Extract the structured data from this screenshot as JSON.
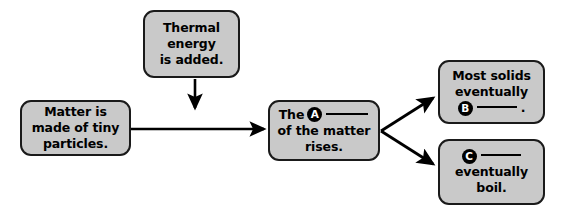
{
  "diagram": {
    "type": "flowchart",
    "background_color": "#ffffff",
    "node_fill_color": "#c9c9c9",
    "node_border_color": "#1a1a1a",
    "text_color": "#000000",
    "marker_fill_color": "#000000",
    "marker_text_color": "#ffffff",
    "nodes": [
      {
        "id": "thermal",
        "name": "thermal-energy-node",
        "lines": [
          "Thermal",
          "energy",
          "is added."
        ],
        "marker": null
      },
      {
        "id": "matter",
        "name": "matter-particles-node",
        "lines": [
          "Matter is",
          "made of tiny",
          "particles."
        ],
        "marker": null
      },
      {
        "id": "middle",
        "name": "matter-rises-node",
        "line1_prefix": "The",
        "marker": "A",
        "line2": "of the matter",
        "line3": "rises."
      },
      {
        "id": "solids",
        "name": "most-solids-node",
        "line1": "Most solids",
        "line2": "eventually",
        "marker": "B",
        "blank_suffix": "."
      },
      {
        "id": "boil",
        "name": "eventually-boil-node",
        "marker": "C",
        "line2": "eventually",
        "line3": "boil."
      }
    ],
    "arrows": [
      {
        "name": "arrow-thermal-to-middle",
        "from": "thermal",
        "to": "middle",
        "direction": "down"
      },
      {
        "name": "arrow-matter-to-middle",
        "from": "matter",
        "to": "middle",
        "direction": "right"
      },
      {
        "name": "arrow-middle-to-solids",
        "from": "middle",
        "to": "solids",
        "direction": "up-right"
      },
      {
        "name": "arrow-middle-to-boil",
        "from": "middle",
        "to": "boil",
        "direction": "down-right"
      }
    ]
  }
}
